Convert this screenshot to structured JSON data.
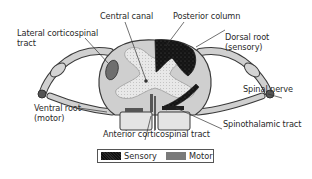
{
  "diagram": {
    "labels": {
      "central_canal": "Central canal",
      "posterior_column": "Posterior column",
      "lateral_corticospinal_line1": "Lateral corticospinal",
      "lateral_corticospinal_line2": "tract",
      "dorsal_root_line1": "Dorsal root",
      "dorsal_root_line2": "(sensory)",
      "spinal_nerve": "Spinal nerve",
      "ventral_root_line1": "Ventral root",
      "ventral_root_line2": "(motor)",
      "spinothalamic_tract": "Spinothalamic tract",
      "anterior_corticospinal_tract": "Anterior corticospinal tract"
    },
    "legend": {
      "items": [
        {
          "label": "Sensory",
          "color": "#1a1a1a",
          "pattern": "speckled-dark"
        },
        {
          "label": "Motor",
          "color": "#7a7a7a",
          "pattern": "mid-gray"
        }
      ]
    },
    "colors": {
      "white_matter": "#cfcfcf",
      "gray_matter": "#e6e6e6",
      "sensory": "#1a1a1a",
      "motor": "#6e6e6e",
      "outline": "#3a3a3a",
      "nerve_root": "#c8c8c8",
      "leader_line": "#333333"
    }
  }
}
